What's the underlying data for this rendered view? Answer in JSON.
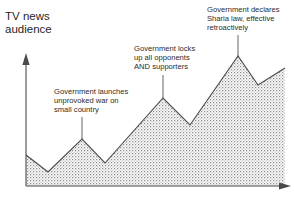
{
  "axis_title": "TV news\naudience",
  "annotations": [
    {
      "id": "unprovoked-war",
      "text": "Government launches\nunprovoked war on\nsmall country",
      "leader_x": 82,
      "leader_y_top": 117,
      "leader_y_bottom": 139
    },
    {
      "id": "locks-up-opponents",
      "text": "Government locks\nup all opponents\nAND supporters",
      "leader_x": 163,
      "leader_y_top": 75,
      "leader_y_bottom": 98
    },
    {
      "id": "sharia-law",
      "text": "Government declares\nSharia law, effective\nretroactively",
      "leader_x": 238,
      "leader_y_top": 35,
      "leader_y_bottom": 56
    }
  ],
  "colors": {
    "line": "#4a4a4a",
    "axis": "#4a4a4a",
    "text": "#2b2b2b",
    "fill_dot": "#8a8a8a",
    "background": "#ffffff"
  },
  "chart_data": {
    "type": "area",
    "title": "TV news audience",
    "xlabel": "",
    "ylabel": "TV news audience",
    "grid": false,
    "legend": "none",
    "axis_arrows": {
      "x": "right",
      "y": "up"
    },
    "axis_origin_px": {
      "x": 26,
      "y": 186
    },
    "x": [
      26,
      48,
      82,
      105,
      163,
      190,
      238,
      258,
      285
    ],
    "values": [
      31,
      14,
      47,
      23,
      88,
      61,
      131,
      101,
      118
    ],
    "points_px": [
      {
        "x": 26,
        "y": 155
      },
      {
        "x": 48,
        "y": 172
      },
      {
        "x": 82,
        "y": 139
      },
      {
        "x": 105,
        "y": 163
      },
      {
        "x": 163,
        "y": 98
      },
      {
        "x": 190,
        "y": 125
      },
      {
        "x": 238,
        "y": 56
      },
      {
        "x": 258,
        "y": 85
      },
      {
        "x": 285,
        "y": 68
      }
    ],
    "series": [
      {
        "name": "TV news audience",
        "values": [
          31,
          14,
          47,
          23,
          88,
          61,
          131,
          101,
          118
        ]
      }
    ],
    "annotation_labels": [
      "Government launches unprovoked war on small country",
      "Government locks up all opponents AND supporters",
      "Government declares Sharia law, effective retroactively"
    ],
    "trend": "increasing",
    "ylim": [
      0,
      145
    ]
  }
}
